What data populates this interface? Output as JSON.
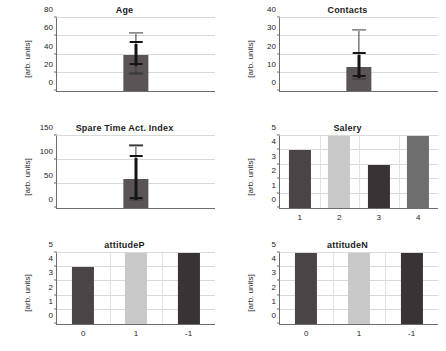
{
  "figure": {
    "ylabel": "[arb. units]",
    "colors": {
      "bar_dark": "#4a4a4a",
      "bar_darkest": "#3a3336",
      "bar_light": "#c8c8c8",
      "bar_medium": "#6e6e6e",
      "error": "#3a3a3a",
      "grid": "#d9d9d9",
      "axis": "#6d6d6d"
    }
  },
  "chart_data": [
    {
      "type": "bar",
      "title": "Age",
      "xlabel": "",
      "ylabel": "[arb. units]",
      "ylim": [
        0,
        80
      ],
      "yticks": [
        0,
        20,
        40,
        60,
        80
      ],
      "categories": [
        ""
      ],
      "values": [
        39
      ],
      "errors_inner": [
        [
          27,
          52
        ]
      ],
      "errors_outer": [
        [
          18,
          62
        ]
      ],
      "bar_colors": [
        "#5a5457"
      ],
      "grid": true,
      "xtick_labels": []
    },
    {
      "type": "bar",
      "title": "Contacts",
      "xlabel": "",
      "ylabel": "[arb. units]",
      "ylim": [
        0,
        40
      ],
      "yticks": [
        0,
        10,
        20,
        30,
        40
      ],
      "categories": [
        ""
      ],
      "values": [
        13
      ],
      "errors_inner": [
        [
          7,
          20
        ]
      ],
      "errors_outer": [
        [
          6,
          33
        ]
      ],
      "bar_colors": [
        "#5a5457"
      ],
      "grid": true,
      "xtick_labels": []
    },
    {
      "type": "bar",
      "title": "Spare Time Act. Index",
      "xlabel": "",
      "ylabel": "[arb. units]",
      "ylim": [
        0,
        150
      ],
      "yticks": [
        0,
        50,
        100,
        150
      ],
      "categories": [
        ""
      ],
      "values": [
        60
      ],
      "errors_inner": [
        [
          16,
          105
        ]
      ],
      "errors_outer": [
        [
          15,
          128
        ]
      ],
      "bar_colors": [
        "#5a5457"
      ],
      "grid": true,
      "xtick_labels": []
    },
    {
      "type": "bar",
      "title": "Salery",
      "xlabel": "",
      "ylabel": "[arb. units]",
      "ylim": [
        0,
        5
      ],
      "yticks": [
        0,
        1,
        2,
        3,
        4,
        5
      ],
      "categories": [
        "1",
        "2",
        "3",
        "4"
      ],
      "values": [
        4,
        5,
        3,
        5
      ],
      "bar_colors": [
        "#4a4446",
        "#c8c8c8",
        "#3a3336",
        "#6e6e6e"
      ],
      "grid": true,
      "xtick_labels": [
        "1",
        "2",
        "3",
        "4"
      ]
    },
    {
      "type": "bar",
      "title": "attitudeP",
      "xlabel": "",
      "ylabel": "[arb. units]",
      "ylim": [
        0,
        5
      ],
      "yticks": [
        0,
        1,
        2,
        3,
        4,
        5
      ],
      "categories": [
        "0",
        "1",
        "-1"
      ],
      "values": [
        4,
        5,
        5
      ],
      "bar_colors": [
        "#4a4446",
        "#c8c8c8",
        "#3a3336"
      ],
      "grid": true,
      "xtick_labels": [
        "0",
        "1",
        "-1"
      ]
    },
    {
      "type": "bar",
      "title": "attitudeN",
      "xlabel": "",
      "ylabel": "[arb. units]",
      "ylim": [
        0,
        5
      ],
      "yticks": [
        0,
        1,
        2,
        3,
        4,
        5
      ],
      "categories": [
        "0",
        "1",
        "-1"
      ],
      "values": [
        5,
        5,
        5
      ],
      "bar_colors": [
        "#4a4446",
        "#c8c8c8",
        "#3a3336"
      ],
      "grid": true,
      "xtick_labels": [
        "0",
        "1",
        "-1"
      ]
    }
  ]
}
